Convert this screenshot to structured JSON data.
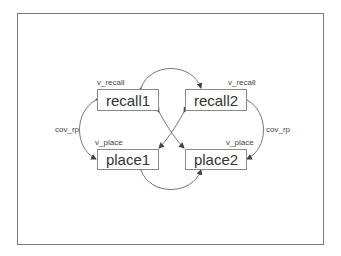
{
  "diagram": {
    "type": "path diagram (SEM)",
    "nodes": [
      {
        "id": "recall1",
        "label": "recall1",
        "variance_label": "v_recall"
      },
      {
        "id": "recall2",
        "label": "recall2",
        "variance_label": "v_recall"
      },
      {
        "id": "place1",
        "label": "place1",
        "variance_label": "v_place"
      },
      {
        "id": "place2",
        "label": "place2",
        "variance_label": "v_place"
      }
    ],
    "edges": [
      {
        "from": "recall1",
        "to": "recall2",
        "type": "covariance",
        "label": ""
      },
      {
        "from": "place1",
        "to": "place2",
        "type": "covariance",
        "label": ""
      },
      {
        "from": "recall1",
        "to": "place1",
        "type": "covariance",
        "label": "cov_rp"
      },
      {
        "from": "recall2",
        "to": "place2",
        "type": "covariance",
        "label": "cov_rp"
      },
      {
        "from": "recall1",
        "to": "place2",
        "type": "covariance",
        "label": ""
      },
      {
        "from": "recall2",
        "to": "place1",
        "type": "covariance",
        "label": ""
      }
    ],
    "edge_labels": {
      "left": "cov_rp",
      "right": "cov_rp"
    }
  },
  "colors": {
    "border": "#7a7a7a",
    "line": "#555555",
    "text": "#333333"
  }
}
